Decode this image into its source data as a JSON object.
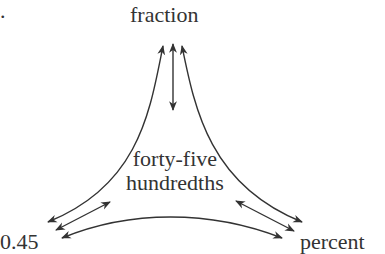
{
  "diagram": {
    "marker": ".",
    "nodes": {
      "top": "fraction",
      "bottom_left": "0.45",
      "bottom_right": "percent",
      "center_line1": "forty-five",
      "center_line2": "hundredths"
    },
    "edges": [
      {
        "from": "fraction",
        "to": "0.45",
        "type": "curved-double-arrow"
      },
      {
        "from": "fraction",
        "to": "percent",
        "type": "curved-double-arrow"
      },
      {
        "from": "fraction",
        "to": "forty-five hundredths",
        "type": "double-arrow"
      },
      {
        "from": "0.45",
        "to": "forty-five hundredths",
        "type": "double-arrow"
      },
      {
        "from": "percent",
        "to": "forty-five hundredths",
        "type": "double-arrow"
      },
      {
        "from": "0.45",
        "to": "percent",
        "type": "curved-double-arrow"
      }
    ],
    "colors": {
      "ink": "#333333",
      "background": "#ffffff"
    }
  }
}
